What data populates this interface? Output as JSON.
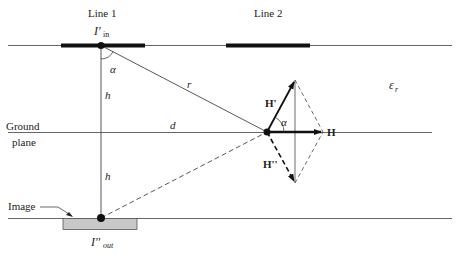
{
  "labels": {
    "line1": "Line 1",
    "line2": "Line 2",
    "current_in_base": "I'",
    "current_in_sub": "in",
    "current_out_base": "I''",
    "current_out_sub": "out",
    "alpha_top": "α",
    "alpha_vector": "α",
    "r": "r",
    "h_upper": "h",
    "h_lower": "h",
    "d": "d",
    "ground_1": "Ground",
    "ground_2": "plane",
    "image": "Image",
    "epsilon_base": "ε",
    "epsilon_sub": "r",
    "H_prime": "H'",
    "H_double_prime": "H''",
    "H": "H"
  },
  "colors": {
    "line": "#555555",
    "conductor": "#111111",
    "image_fill": "#c8c8c8",
    "dashed": "#444444"
  }
}
